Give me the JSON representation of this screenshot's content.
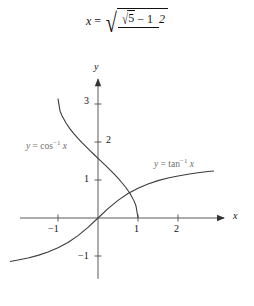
{
  "equation": {
    "lhs": "x",
    "equals": "=",
    "radical_symbol": "√",
    "numerator_inner_radical": "√",
    "numerator_radicand": "5",
    "numerator_rest": "− 1",
    "denominator": "2",
    "plain_text": "x = √((√5 − 1)/2)"
  },
  "chart_data": {
    "type": "line",
    "title": "",
    "xlabel": "x",
    "ylabel": "y",
    "xlim": [
      -1.95,
      3.1
    ],
    "ylim": [
      -1.6,
      3.6
    ],
    "grid": false,
    "x_ticks": [
      -1,
      1,
      2
    ],
    "x_tick_labels": [
      "−1",
      "1",
      "2"
    ],
    "y_ticks": [
      1,
      2,
      3,
      -1
    ],
    "y_tick_labels": [
      "1",
      "2",
      "3",
      "−1"
    ],
    "axis_arrows": [
      "x-positive",
      "y-positive"
    ],
    "series": [
      {
        "name": "y = cos⁻¹ x",
        "label_parts": {
          "y": "y",
          "eq": "=",
          "fn": "cos",
          "exp": "−1",
          "arg": "x"
        },
        "domain": [
          -1,
          1
        ],
        "range": [
          0,
          3.1416
        ],
        "points": [
          [
            -1,
            3.1416
          ],
          [
            -0.95,
            2.8198
          ],
          [
            -0.9,
            2.6906
          ],
          [
            -0.8,
            2.4981
          ],
          [
            -0.7,
            2.3462
          ],
          [
            -0.6,
            2.2143
          ],
          [
            -0.5,
            2.0944
          ],
          [
            -0.4,
            1.9823
          ],
          [
            -0.3,
            1.8755
          ],
          [
            -0.2,
            1.7722
          ],
          [
            -0.1,
            1.671
          ],
          [
            0,
            1.5708
          ],
          [
            0.1,
            1.4706
          ],
          [
            0.2,
            1.3694
          ],
          [
            0.3,
            1.2661
          ],
          [
            0.4,
            1.1593
          ],
          [
            0.5,
            1.0472
          ],
          [
            0.6,
            0.9273
          ],
          [
            0.7,
            0.7954
          ],
          [
            0.8,
            0.6435
          ],
          [
            0.9,
            0.451
          ],
          [
            0.95,
            0.3176
          ],
          [
            1,
            0
          ]
        ]
      },
      {
        "name": "y = tan⁻¹ x",
        "label_parts": {
          "y": "y",
          "eq": "=",
          "fn": "tan",
          "exp": "−1",
          "arg": "x"
        },
        "domain": [
          -2.2,
          2.9
        ],
        "range": [
          -1.144,
          1.238
        ],
        "points": [
          [
            -2.2,
            -1.1442
          ],
          [
            -2.0,
            -1.1071
          ],
          [
            -1.75,
            -1.0517
          ],
          [
            -1.5,
            -0.9828
          ],
          [
            -1.25,
            -0.8961
          ],
          [
            -1.0,
            -0.7854
          ],
          [
            -0.75,
            -0.6435
          ],
          [
            -0.5,
            -0.4636
          ],
          [
            -0.25,
            -0.245
          ],
          [
            0,
            0
          ],
          [
            0.25,
            0.245
          ],
          [
            0.5,
            0.4636
          ],
          [
            0.75,
            0.6435
          ],
          [
            1.0,
            0.7854
          ],
          [
            1.25,
            0.8961
          ],
          [
            1.5,
            0.9828
          ],
          [
            1.75,
            1.0517
          ],
          [
            2.0,
            1.1071
          ],
          [
            2.25,
            1.1526
          ],
          [
            2.5,
            1.1903
          ],
          [
            2.75,
            1.222
          ],
          [
            2.9,
            1.2388
          ]
        ]
      }
    ]
  },
  "plot_geometry": {
    "origin_x": 98,
    "origin_y": 218,
    "unit_x": 40,
    "unit_y": 38
  },
  "colors": {
    "curve": "#3b3b3b",
    "axis": "#5a5a5a",
    "label": "#6e6e6e",
    "text": "#111111",
    "background": "#ffffff"
  }
}
